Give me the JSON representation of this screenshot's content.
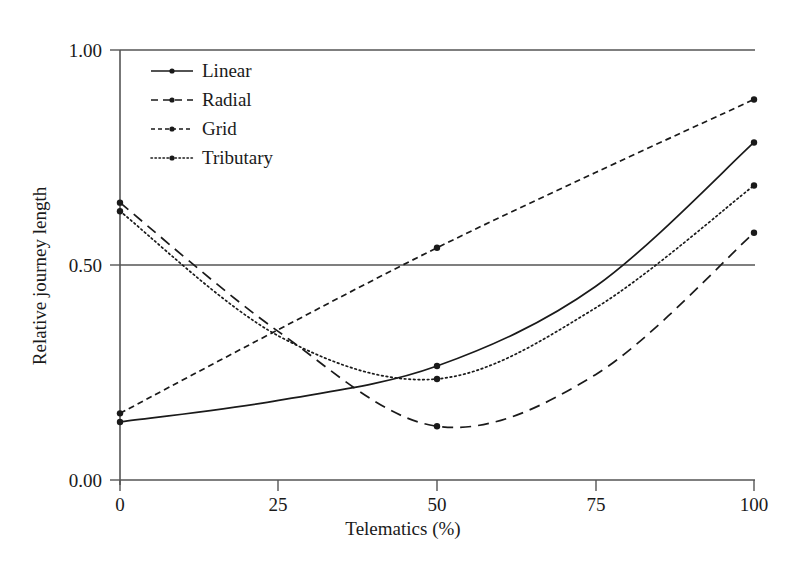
{
  "chart_data": {
    "type": "line",
    "title": "",
    "xlabel": "Telematics (%)",
    "ylabel": "Relative journey length",
    "xlim": [
      0,
      100
    ],
    "ylim": [
      0.0,
      1.0
    ],
    "xticks": [
      0,
      25,
      50,
      75,
      100
    ],
    "xtick_labels": [
      "0",
      "25",
      "50",
      "75",
      "100"
    ],
    "yticks": [
      0.0,
      0.5,
      1.0
    ],
    "ytick_labels": [
      "0.00",
      "0.50",
      "1.00"
    ],
    "grid": "horizontal-at-0.50-and-1.00",
    "legend_position": "upper-left-inside",
    "x": [
      0,
      25,
      50,
      75,
      100
    ],
    "series": [
      {
        "name": "Linear",
        "style": "solid",
        "marker": "circle",
        "marker_x": [
          0,
          50,
          100
        ],
        "marker_values": [
          0.135,
          0.265,
          0.785
        ],
        "values": [
          0.135,
          0.185,
          0.265,
          0.45,
          0.785
        ]
      },
      {
        "name": "Radial",
        "style": "dashed",
        "marker": "circle",
        "marker_x": [
          0,
          50,
          100
        ],
        "marker_values": [
          0.645,
          0.125,
          0.575
        ],
        "values": [
          0.645,
          0.345,
          0.125,
          0.245,
          0.575
        ]
      },
      {
        "name": "Grid",
        "style": "dash-dot",
        "marker": "circle",
        "marker_x": [
          0,
          50,
          100
        ],
        "marker_values": [
          0.155,
          0.54,
          0.885
        ],
        "values": [
          0.155,
          0.35,
          0.54,
          0.715,
          0.885
        ]
      },
      {
        "name": "Tributary",
        "style": "dotted",
        "marker": "circle",
        "marker_x": [
          0,
          50,
          100
        ],
        "marker_values": [
          0.625,
          0.235,
          0.685
        ],
        "values": [
          0.625,
          0.335,
          0.235,
          0.4,
          0.685
        ]
      }
    ]
  },
  "axes": {
    "ylabel": "Relative journey length",
    "xlabel": "Telematics (%)",
    "ytick_0": "0.00",
    "ytick_1": "0.50",
    "ytick_2": "1.00",
    "xtick_0": "0",
    "xtick_1": "25",
    "xtick_2": "50",
    "xtick_3": "75",
    "xtick_4": "100"
  },
  "legend": {
    "items": [
      {
        "label": "Linear"
      },
      {
        "label": "Radial"
      },
      {
        "label": "Grid"
      },
      {
        "label": "Tributary"
      }
    ]
  },
  "colors": {
    "line": "#1a1a1a",
    "axis": "#4a4a4a",
    "grid": "#555555",
    "background": "#ffffff"
  }
}
